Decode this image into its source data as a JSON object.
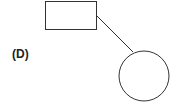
{
  "diagram": {
    "label": "(D)",
    "shapes": [
      "rectangle",
      "circle"
    ],
    "connector": "line",
    "stroke_color": "#333333",
    "fill_color": "#ffffff"
  }
}
